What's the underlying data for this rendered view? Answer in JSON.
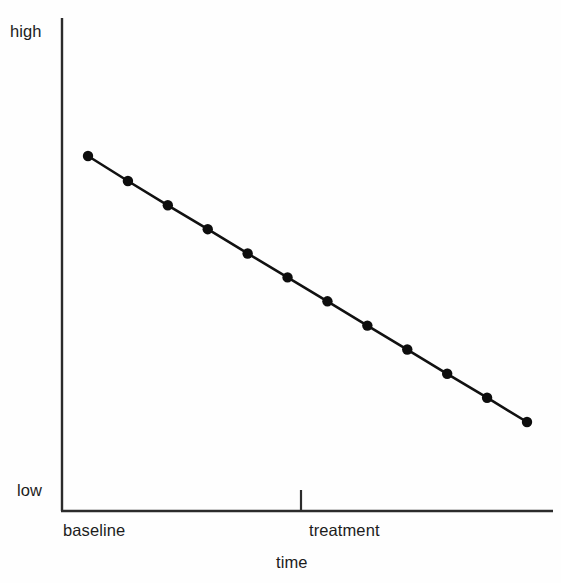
{
  "chart_data": {
    "type": "line",
    "title": "",
    "subtitle": "",
    "xlabel": "time",
    "ylabel": "",
    "grid": false,
    "legend": null,
    "y_axis": {
      "tick_labels": [
        "high",
        "low"
      ],
      "high_label": "high",
      "low_label": "low",
      "range_描述": "low to high (unlabeled ordinal scale)",
      "ylim": [
        0,
        1
      ]
    },
    "x_axis": {
      "phase_labels": [
        "baseline",
        "treatment"
      ],
      "phase_divider_tick": true,
      "divider_position_fraction": 0.487,
      "xlabel": "time"
    },
    "series": [
      {
        "name": "measure",
        "marker": "filled-circle",
        "line_style": "solid",
        "color": "#111111",
        "points": [
          {
            "x": 1,
            "y": 0.885
          },
          {
            "x": 2,
            "y": 0.815
          },
          {
            "x": 3,
            "y": 0.747
          },
          {
            "x": 4,
            "y": 0.68
          },
          {
            "x": 5,
            "y": 0.612
          },
          {
            "x": 6,
            "y": 0.545
          },
          {
            "x": 7,
            "y": 0.478
          },
          {
            "x": 8,
            "y": 0.41
          },
          {
            "x": 9,
            "y": 0.343
          },
          {
            "x": 10,
            "y": 0.275
          },
          {
            "x": 11,
            "y": 0.208
          },
          {
            "x": 12,
            "y": 0.14
          }
        ]
      }
    ],
    "annotations": []
  },
  "labels": {
    "high": "high",
    "low": "low",
    "baseline": "baseline",
    "treatment": "treatment",
    "time": "time"
  },
  "colors": {
    "axis": "#2b2b2b",
    "line": "#111111",
    "marker": "#0d0d0d",
    "background": "#fefefe",
    "text": "#1c1c1c"
  },
  "geometry": {
    "axis_x": 62,
    "axis_top": 18,
    "axis_bottom": 511,
    "axis_right": 553,
    "tick_x": 301,
    "tick_top": 490,
    "point_x_start": 88,
    "point_x_end": 527,
    "point_y_start": 156,
    "point_y_end": 422,
    "marker_radius": 5.2,
    "line_width": 2.6
  }
}
